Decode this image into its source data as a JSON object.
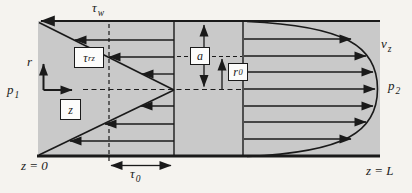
{
  "theme": {
    "page_bg": "#f5f3ef",
    "canvas_fill": "#c9c9c9",
    "line_color": "#1a1a1a",
    "box_fill": "#fcfcfb"
  },
  "diagram": {
    "labels": {
      "tau_w": {
        "base": "τ",
        "sub": "w"
      },
      "tau_rz": {
        "base": "τ",
        "sub": "rz"
      },
      "tau_0": {
        "base": "τ",
        "sub": "0"
      },
      "r_axis": {
        "base": "r",
        "sub": ""
      },
      "z_box": {
        "base": "z",
        "sub": ""
      },
      "a_box": {
        "base": "a",
        "sub": ""
      },
      "r0_box": {
        "base": "r",
        "sub": "0"
      },
      "p1": {
        "base": "p",
        "sub": "1"
      },
      "p2": {
        "base": "p",
        "sub": "2"
      },
      "vz": {
        "base": "v",
        "sub": "z"
      },
      "z_start": {
        "base": "z = 0",
        "sub": ""
      },
      "z_end": {
        "base": "z = L",
        "sub": ""
      }
    }
  }
}
